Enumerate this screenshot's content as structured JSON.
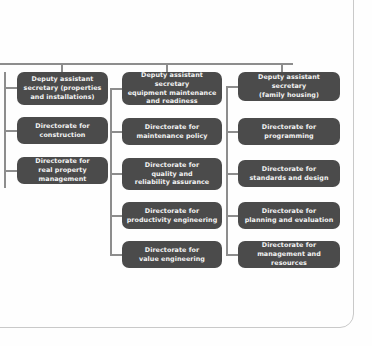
{
  "diagram": {
    "type": "organization-chart",
    "colors": {
      "node_fill": "#4b4b4b",
      "node_text": "#f4f4f4",
      "connector": "#8d8d8d",
      "page_background": "#fefefe",
      "page_border": "#c9c9c9"
    },
    "columns": [
      {
        "id": "properties-and-installations",
        "header": {
          "id": "dep-asst-sec-properties",
          "label": "Deputy assistant\nsecretary (properties\nand installations)"
        },
        "children": [
          {
            "id": "directorate-construction",
            "label": "Directorate for\nconstruction"
          },
          {
            "id": "directorate-real-property-management",
            "label": "Directorate for\nreal property management"
          }
        ]
      },
      {
        "id": "equipment-maintenance-and-readiness",
        "header": {
          "id": "dep-asst-sec-equipment-maintenance",
          "label": "Deputy assistant secretary\nequipment maintenance\nand readiness"
        },
        "children": [
          {
            "id": "directorate-maintenance-policy",
            "label": "Directorate for\nmaintenance policy"
          },
          {
            "id": "directorate-quality-and-reliability-assurance",
            "label": "Directorate for\nquality and\nreliability assurance"
          },
          {
            "id": "directorate-productivity-engineering",
            "label": "Directorate for\nproductivity engineering"
          },
          {
            "id": "directorate-value-engineering",
            "label": "Directorate for\nvalue engineering"
          }
        ]
      },
      {
        "id": "family-housing",
        "header": {
          "id": "dep-asst-sec-family-housing",
          "label": "Deputy assistant secretary\n(family housing)"
        },
        "children": [
          {
            "id": "directorate-programming",
            "label": "Directorate for\nprogramming"
          },
          {
            "id": "directorate-standards-and-design",
            "label": "Directorate for\nstandards and design"
          },
          {
            "id": "directorate-planning-and-evaluation",
            "label": "Directorate for\nplanning and evaluation"
          },
          {
            "id": "directorate-management-and-resources",
            "label": "Directorate for\nmanagement and resources"
          }
        ]
      }
    ]
  }
}
